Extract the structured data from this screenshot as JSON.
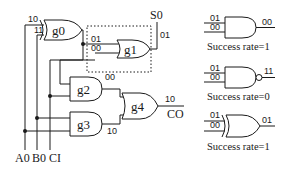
{
  "circuit": {
    "inputs": [
      "A0",
      "B0",
      "CI"
    ],
    "outputs": {
      "sum": "S0",
      "carry": "CO"
    },
    "gates": [
      {
        "id": "g0",
        "type": "XOR",
        "label": "g0",
        "input_values": [
          "10",
          "11"
        ]
      },
      {
        "id": "g1",
        "type": "XOR",
        "label": "g1",
        "input_values": [
          "01",
          "00"
        ],
        "output_value": "01",
        "highlighted": true
      },
      {
        "id": "g2",
        "type": "AND",
        "label": "g2",
        "output_value": "00"
      },
      {
        "id": "g3",
        "type": "AND",
        "label": "g3",
        "output_value": "10"
      },
      {
        "id": "g4",
        "type": "OR",
        "label": "g4",
        "output_value": "10"
      }
    ],
    "s0_value": "01",
    "co_value": "10"
  },
  "candidates": [
    {
      "type": "AND",
      "inputs": [
        "01",
        "00"
      ],
      "output": "00",
      "caption": "Success rate=1"
    },
    {
      "type": "NAND",
      "inputs": [
        "01",
        "00"
      ],
      "output": "11",
      "caption": "Success rate=0"
    },
    {
      "type": "XOR",
      "inputs": [
        "01",
        "00"
      ],
      "output": "01",
      "caption": "Success rate=1"
    }
  ]
}
